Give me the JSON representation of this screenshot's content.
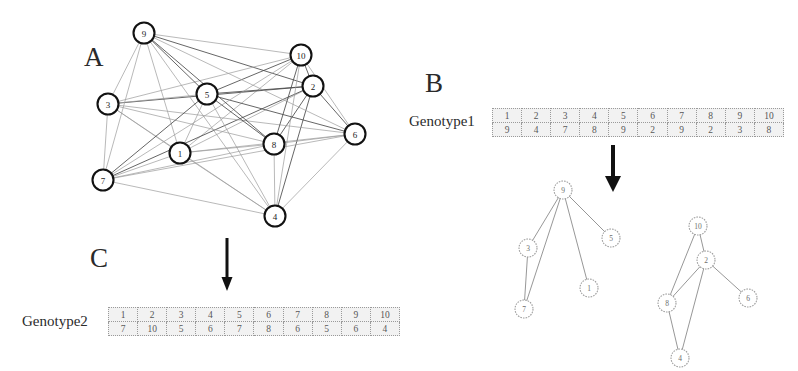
{
  "panels": {
    "a": {
      "letter": "A",
      "caption": "complete weighted graph of 10 nodes"
    },
    "b": {
      "letter": "B",
      "caption": "genotype1 decoded into two spanning subtrees"
    },
    "c": {
      "letter": "C",
      "caption": "genotype2"
    }
  },
  "graph_a": {
    "nodes": [
      {
        "id": "1",
        "x": 180,
        "y": 153
      },
      {
        "id": "2",
        "x": 313,
        "y": 86
      },
      {
        "id": "3",
        "x": 108,
        "y": 104
      },
      {
        "id": "4",
        "x": 275,
        "y": 216
      },
      {
        "id": "5",
        "x": 207,
        "y": 94
      },
      {
        "id": "6",
        "x": 355,
        "y": 134
      },
      {
        "id": "7",
        "x": 103,
        "y": 180
      },
      {
        "id": "8",
        "x": 274,
        "y": 144
      },
      {
        "id": "9",
        "x": 144,
        "y": 33
      },
      {
        "id": "10",
        "x": 301,
        "y": 55
      }
    ],
    "edges_note": "complete graph: every pair of the 10 nodes is connected"
  },
  "genotype1": {
    "label": "Genotype1",
    "index_row": [
      "1",
      "2",
      "3",
      "4",
      "5",
      "6",
      "7",
      "8",
      "9",
      "10"
    ],
    "value_row": [
      "9",
      "4",
      "7",
      "8",
      "9",
      "2",
      "9",
      "2",
      "3",
      "8"
    ]
  },
  "genotype2": {
    "label": "Genotype2",
    "index_row": [
      "1",
      "2",
      "3",
      "4",
      "5",
      "6",
      "7",
      "8",
      "9",
      "10"
    ],
    "value_row": [
      "7",
      "10",
      "5",
      "6",
      "7",
      "8",
      "6",
      "5",
      "6",
      "4"
    ]
  },
  "trees": {
    "left": {
      "nodes": [
        {
          "id": "9",
          "x": 75,
          "y": 12
        },
        {
          "id": "3",
          "x": 40,
          "y": 70
        },
        {
          "id": "5",
          "x": 123,
          "y": 60
        },
        {
          "id": "1",
          "x": 101,
          "y": 110
        },
        {
          "id": "7",
          "x": 36,
          "y": 131
        }
      ],
      "edges": [
        [
          "9",
          "3"
        ],
        [
          "9",
          "5"
        ],
        [
          "9",
          "1"
        ],
        [
          "9",
          "7"
        ],
        [
          "3",
          "7"
        ]
      ]
    },
    "right": {
      "nodes": [
        {
          "id": "10",
          "x": 58,
          "y": 8
        },
        {
          "id": "2",
          "x": 66,
          "y": 42
        },
        {
          "id": "8",
          "x": 27,
          "y": 85
        },
        {
          "id": "6",
          "x": 108,
          "y": 80
        },
        {
          "id": "4",
          "x": 40,
          "y": 140
        }
      ],
      "edges": [
        [
          "10",
          "2"
        ],
        [
          "10",
          "8"
        ],
        [
          "2",
          "8"
        ],
        [
          "2",
          "6"
        ],
        [
          "2",
          "4"
        ],
        [
          "8",
          "4"
        ]
      ]
    }
  },
  "arrows": {
    "a_to_c": {
      "name": "down-arrow-a-to-c"
    },
    "b_to_trees": {
      "name": "down-arrow-b-to-trees"
    }
  }
}
